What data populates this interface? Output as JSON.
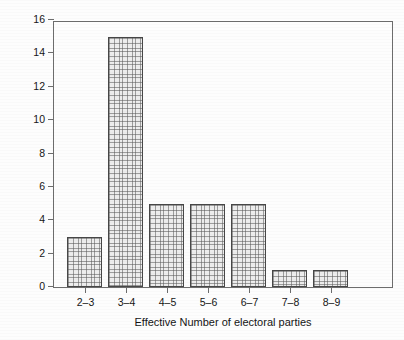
{
  "chart_data": {
    "type": "bar",
    "title": "",
    "xlabel": "Effective Number of electoral parties",
    "ylabel": "Number of countries",
    "categories": [
      "2–3",
      "3–4",
      "4–5",
      "5–6",
      "6–7",
      "7–8",
      "8–9"
    ],
    "values": [
      3,
      15,
      5,
      5,
      5,
      1,
      1
    ],
    "ylim": [
      0,
      16
    ],
    "yticks": [
      0,
      2,
      4,
      6,
      8,
      10,
      12,
      14,
      16
    ],
    "ytick_labels": [
      "0",
      "2",
      "4",
      "6",
      "8",
      "10",
      "12",
      "14",
      "16"
    ],
    "grid": false,
    "legend": null,
    "colors": {
      "bar_fill": "#ededed",
      "bar_hatch": "#5a5a5a",
      "bar_edge": "#474747",
      "axis": "#6d6d6d",
      "text": "#151515",
      "background": "#fdfdfd"
    }
  }
}
